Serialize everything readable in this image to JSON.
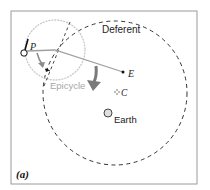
{
  "diagram": {
    "panel_label": "(a)",
    "labels": {
      "deferent": "Deferent",
      "epicycle": "Epicycle",
      "earth": "Earth",
      "planet": "P",
      "equant": "E",
      "center": "C"
    },
    "colors": {
      "frame": "#9a9a9a",
      "deferent": "#333333",
      "epicycle": "#c8c8c8",
      "epicycle_label": "#a8a8a8",
      "radius_line": "#9a9a9a",
      "big_arrow": "#7a7a7a",
      "small_arrow": "#8a8a8a",
      "text": "#222222"
    }
  }
}
